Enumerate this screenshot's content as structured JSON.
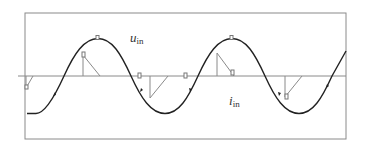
{
  "diagram": {
    "title": "",
    "signals": [
      {
        "id": "u_in",
        "symbol": "u",
        "subscript": "in",
        "role": "input voltage waveform"
      },
      {
        "id": "i_in",
        "symbol": "i",
        "subscript": "in",
        "role": "input current waveform"
      }
    ],
    "labels": {
      "u_main": "u",
      "u_sub": "in",
      "i_main": "i",
      "i_sub": "in"
    },
    "colors": {
      "curve": "#222222",
      "axis": "#8a8a8a",
      "frame": "#8a8a8a",
      "marker": "#777777"
    },
    "geometry": {
      "frame": {
        "left": 25,
        "top": 13,
        "right": 346,
        "bottom": 139
      },
      "axis_y": 76,
      "axis_x_start": 18,
      "wave": {
        "amplitude_px": 37.5,
        "period_px": 134,
        "first_zero_cross_x": 64,
        "peak_xs": [
          98,
          232
        ],
        "trough_xs": [
          165,
          299
        ]
      }
    }
  }
}
